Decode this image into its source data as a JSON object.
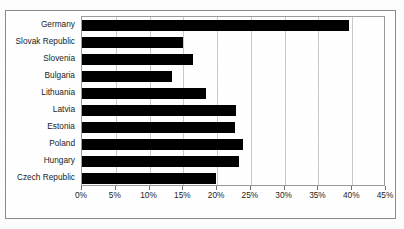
{
  "chart_data": {
    "type": "bar",
    "orientation": "horizontal",
    "title": "",
    "subtitle": "",
    "xlabel": "",
    "ylabel": "",
    "xlim": [
      0,
      45
    ],
    "grid": true,
    "legend": null,
    "value_suffix": "%",
    "categories": [
      "Germany",
      "Slovak Republic",
      "Slovenia",
      "Bulgaria",
      "Lithuania",
      "Latvia",
      "Estonia",
      "Poland",
      "Hungary",
      "Czech Republic"
    ],
    "values": [
      39.5,
      15.0,
      16.5,
      13.3,
      18.4,
      22.8,
      22.6,
      23.8,
      23.2,
      19.9
    ],
    "xticks": [
      0,
      5,
      10,
      15,
      20,
      25,
      30,
      35,
      40,
      45
    ],
    "xtick_labels": [
      "0%",
      "5%",
      "10%",
      "15%",
      "20%",
      "25%",
      "30%",
      "35%",
      "40%",
      "45%"
    ],
    "bar_color": "#000000",
    "gridline_color": "#c9c9c9",
    "plot_border_color": "#9b9b9b",
    "frame_color": "#8a8a8a",
    "background_color": "#ffffff"
  }
}
